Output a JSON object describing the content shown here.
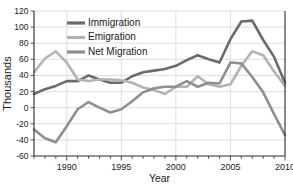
{
  "chart_data": {
    "type": "line",
    "title": "",
    "xlabel": "Year",
    "ylabel": "Thousands",
    "xlim": [
      1987,
      2010
    ],
    "ylim": [
      -60,
      120
    ],
    "ytick_step": 20,
    "xticks": [
      1990,
      1995,
      2000,
      2005,
      2010
    ],
    "yticks": [
      -60,
      -40,
      -20,
      0,
      20,
      40,
      60,
      80,
      100,
      120
    ],
    "grid": true,
    "legend_position": "top-center",
    "x": [
      1987,
      1988,
      1989,
      1990,
      1991,
      1992,
      1993,
      1994,
      1995,
      1996,
      1997,
      1998,
      1999,
      2000,
      2001,
      2002,
      2003,
      2004,
      2005,
      2006,
      2007,
      2008,
      2009,
      2010
    ],
    "series": [
      {
        "name": "Immigration",
        "color": "#6b6b6b",
        "values": [
          17,
          23,
          27,
          33,
          33,
          40,
          35,
          31,
          31,
          39,
          44,
          46,
          48,
          52,
          59,
          65,
          60,
          56,
          85,
          107,
          108,
          84,
          63,
          31
        ]
      },
      {
        "name": "Emigration",
        "color": "#b3b3b3",
        "values": [
          44,
          61,
          70,
          56,
          35,
          33,
          35,
          35,
          34,
          31,
          25,
          22,
          17,
          26,
          26,
          39,
          29,
          26,
          29,
          52,
          70,
          65,
          45,
          27
        ]
      },
      {
        "name": "Net Migration",
        "color": "#8f8f8f",
        "values": [
          -27,
          -38,
          -43,
          -23,
          -2,
          7,
          0,
          -6,
          -2,
          8,
          19,
          24,
          26,
          26,
          33,
          26,
          31,
          30,
          56,
          55,
          38,
          19,
          -8,
          -34
        ]
      }
    ]
  },
  "legend": {
    "items": [
      {
        "label": "Immigration"
      },
      {
        "label": "Emigration"
      },
      {
        "label": "Net Migration"
      }
    ]
  },
  "axes": {
    "y_title": "Thousands",
    "x_title": "Year"
  }
}
